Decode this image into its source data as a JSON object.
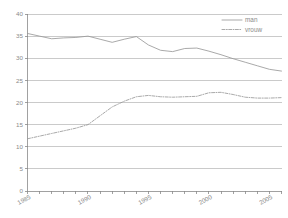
{
  "chart_data": {
    "type": "line",
    "title": "",
    "subtitle": "",
    "xlabel": "",
    "ylabel": "",
    "xlim": [
      1985,
      2006
    ],
    "ylim": [
      0,
      40
    ],
    "grid": true,
    "grid_axis": "y",
    "legend_position": "top-right",
    "x": [
      1985,
      1986,
      1987,
      1988,
      1989,
      1990,
      1991,
      1992,
      1993,
      1994,
      1995,
      1996,
      1997,
      1998,
      1999,
      2000,
      2001,
      2002,
      2003,
      2004,
      2005,
      2006
    ],
    "series": [
      {
        "name": "man",
        "linestyle": "solid",
        "color": "#9a9a9a",
        "values": [
          35.6,
          35.0,
          34.4,
          34.6,
          34.7,
          35.0,
          34.3,
          33.6,
          34.3,
          34.9,
          33.0,
          31.8,
          31.5,
          32.2,
          32.3,
          31.6,
          30.8,
          29.9,
          29.1,
          28.3,
          27.5,
          27.1
        ]
      },
      {
        "name": "vrouw",
        "linestyle": "dashdot",
        "color": "#9a9a9a",
        "values": [
          11.8,
          12.4,
          13.0,
          13.6,
          14.2,
          15.0,
          17.0,
          19.0,
          20.3,
          21.3,
          21.6,
          21.3,
          21.2,
          21.3,
          21.4,
          22.2,
          22.3,
          21.8,
          21.2,
          21.0,
          21.0,
          21.1
        ]
      }
    ],
    "y_ticks": [
      0,
      5,
      10,
      15,
      20,
      25,
      30,
      35,
      40
    ],
    "y_tick_labels": [
      "0",
      "5",
      "10",
      "15",
      "20",
      "25",
      "30",
      "35",
      "40"
    ],
    "x_ticks": [
      1985,
      1986,
      1987,
      1988,
      1989,
      1990,
      1991,
      1992,
      1993,
      1994,
      1995,
      1996,
      1997,
      1998,
      1999,
      2000,
      2001,
      2002,
      2003,
      2004,
      2005,
      2006
    ],
    "x_tick_labels_shown": [
      "1985",
      "1990",
      "1995",
      "2000",
      "2005"
    ],
    "x_tick_label_years": [
      1985,
      1990,
      1995,
      2000,
      2005
    ]
  },
  "legend": {
    "entries": [
      {
        "label": "man",
        "style": "solid"
      },
      {
        "label": "vrouw",
        "style": "dashdot"
      }
    ]
  },
  "colors": {
    "line": "#9a9a9a",
    "grid": "#b4b4b4",
    "axis": "#8a8a8a",
    "text": "#8a8a8a",
    "background": "#ffffff"
  }
}
